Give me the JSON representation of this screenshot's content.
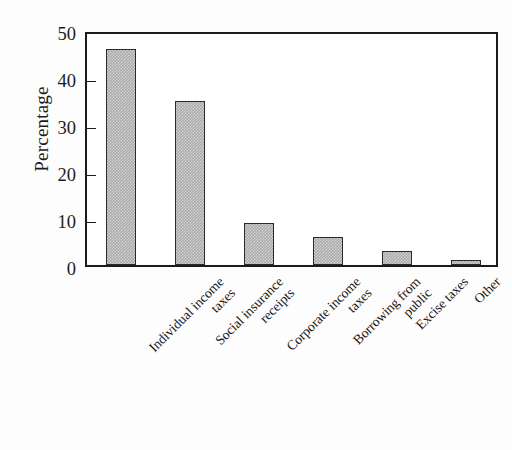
{
  "chart_data": {
    "type": "bar",
    "title": "",
    "xlabel": "",
    "ylabel": "Percentage",
    "ylim": [
      0,
      50
    ],
    "yticks": [
      0,
      10,
      20,
      30,
      40,
      50
    ],
    "grid": false,
    "legend": null,
    "categories": [
      "Individual income taxes",
      "Social insurance receipts",
      "Corporate income taxes",
      "Borrowing from public",
      "Excise taxes",
      "Other"
    ],
    "category_lines": [
      [
        "Individual income",
        "taxes"
      ],
      [
        "Social insurance",
        "receipts"
      ],
      [
        "Corporate income",
        "taxes"
      ],
      [
        "Borrowing from",
        "public"
      ],
      [
        "Excise taxes",
        ""
      ],
      [
        "Other",
        ""
      ]
    ],
    "values": [
      46,
      35,
      9,
      6,
      3,
      1
    ],
    "bar_color": "#ababab",
    "bar_edge_color": "#2a2a2a",
    "axis_color": "#1b1b1b",
    "background_color": "#ffffff"
  }
}
